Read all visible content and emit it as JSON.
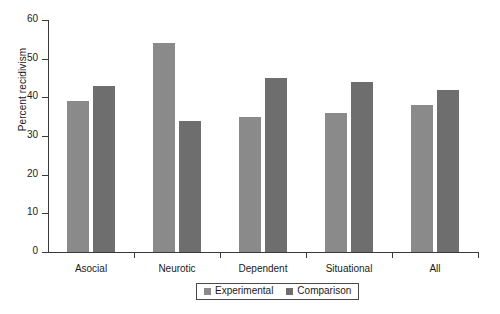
{
  "chart_data": {
    "type": "bar",
    "title": "",
    "xlabel": "",
    "ylabel": "Percent recidivism",
    "ylim": [
      0,
      60
    ],
    "ytick_values": [
      0,
      10,
      20,
      30,
      40,
      50,
      60
    ],
    "ytick_labels": [
      "0",
      "10",
      "20",
      "30",
      "40",
      "50",
      "60"
    ],
    "grid": false,
    "legend_position": "bottom",
    "categories": [
      "Asocial",
      "Neurotic",
      "Dependent",
      "Situational",
      "All"
    ],
    "series": [
      {
        "name": "Experimental",
        "color": "#8a8a8a",
        "values": [
          39,
          54,
          35,
          36,
          38
        ]
      },
      {
        "name": "Comparison",
        "color": "#6e6e6e",
        "values": [
          43,
          34,
          45,
          44,
          42
        ]
      }
    ]
  },
  "axis": {
    "line_color": "#3a3a3a"
  },
  "legend": {
    "entries": [
      "Experimental",
      "Comparison"
    ]
  }
}
